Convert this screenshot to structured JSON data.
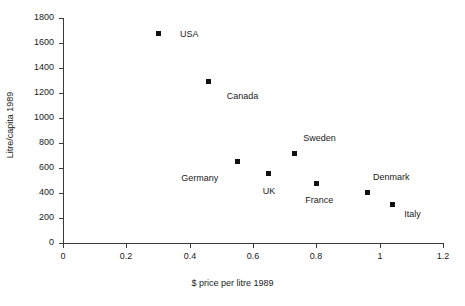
{
  "chart_data": {
    "type": "scatter",
    "title": "",
    "xlabel": "$ price per litre 1989",
    "ylabel": "Litre/capita 1989",
    "xlim": [
      0,
      1.2
    ],
    "ylim": [
      0,
      1800
    ],
    "grid": false,
    "legend": "none",
    "xticks": [
      "0",
      "0.2",
      "0.4",
      "0.6",
      "0.8",
      "1",
      "1.2"
    ],
    "xtick_values": [
      0,
      0.2,
      0.4,
      0.6,
      0.8,
      1,
      1.2
    ],
    "yticks": [
      "0",
      "200",
      "400",
      "600",
      "800",
      "1000",
      "1200",
      "1400",
      "1600",
      "1800"
    ],
    "ytick_values": [
      0,
      200,
      400,
      600,
      800,
      1000,
      1200,
      1400,
      1600,
      1800
    ],
    "marker_style": "filled-square",
    "marker_color": "#111111",
    "points": [
      {
        "label": "USA",
        "x": 0.3,
        "y": 1680,
        "label_dx": 22,
        "label_dy": 1
      },
      {
        "label": "Canada",
        "x": 0.46,
        "y": 1290,
        "label_dx": 18,
        "label_dy": 14
      },
      {
        "label": "Germany",
        "x": 0.55,
        "y": 650,
        "label_dx": -56,
        "label_dy": 16
      },
      {
        "label": "UK",
        "x": 0.65,
        "y": 555,
        "label_dx": -6,
        "label_dy": 17
      },
      {
        "label": "Sweden",
        "x": 0.73,
        "y": 715,
        "label_dx": 9,
        "label_dy": -16
      },
      {
        "label": "France",
        "x": 0.8,
        "y": 480,
        "label_dx": -11,
        "label_dy": 17
      },
      {
        "label": "Denmark",
        "x": 0.96,
        "y": 405,
        "label_dx": 6,
        "label_dy": -15
      },
      {
        "label": "Italy",
        "x": 1.04,
        "y": 310,
        "label_dx": 12,
        "label_dy": 10
      }
    ]
  },
  "artifact": {
    "top_strip_text": "  .      ..  .          ."
  }
}
